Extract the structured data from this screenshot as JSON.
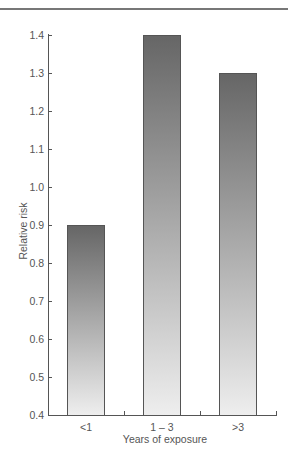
{
  "chart_data": {
    "type": "bar",
    "title": "",
    "xlabel": "Years of exposure",
    "ylabel": "Relative risk",
    "categories": [
      "<1",
      "1 – 3",
      ">3"
    ],
    "values": [
      0.9,
      1.4,
      1.3
    ],
    "ylim": [
      0.4,
      1.4
    ],
    "yticks": [
      "0.4",
      "0.5",
      "0.6",
      "0.7",
      "0.8",
      "0.9",
      "1.0",
      "1.1",
      "1.2",
      "1.3",
      "1.4"
    ],
    "grid": false,
    "legend": null,
    "bar_style": "vertical gradient, dark gray top to light gray bottom",
    "colors": {
      "bar_top": "#666666",
      "bar_bottom": "#eeeeee",
      "axis": "#555555"
    }
  }
}
